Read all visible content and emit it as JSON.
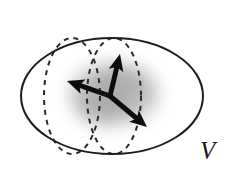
{
  "figure": {
    "background_color": "#ffffff",
    "width": 231,
    "height": 173
  },
  "labels": {
    "region": {
      "text": "V",
      "name": "volume-label-V",
      "x": 200,
      "y": 138,
      "font_size": 25,
      "color": "#1a1a1a",
      "style": "italic-serif"
    }
  },
  "shapes": {
    "outer_ellipse": {
      "name": "outer-ellipse",
      "cx": 112,
      "cy": 96,
      "rx": 91,
      "ry": 58,
      "stroke": "#1f1f1f",
      "stroke_width": 2.0,
      "fill": "none",
      "dashed": false
    },
    "dashed_ellipse_left": {
      "name": "dashed-ellipse-left",
      "cx": 72,
      "cy": 96,
      "rx": 28,
      "ry": 58,
      "stroke": "#2a2a2a",
      "stroke_width": 2.0,
      "dash_pattern": "5 5",
      "fill": "none"
    },
    "dashed_ellipse_right": {
      "name": "dashed-ellipse-right",
      "cx": 114,
      "cy": 96,
      "rx": 27,
      "ry": 58,
      "stroke": "#2a2a2a",
      "stroke_width": 2.0,
      "dash_pattern": "5 5",
      "fill": "none"
    },
    "blur_cloud": {
      "name": "gray-blur-cloud",
      "cx": 114,
      "cy": 94,
      "rx": 44,
      "ry": 30,
      "color": "#9a9a9a",
      "opacity": 0.62,
      "blur": 9
    }
  },
  "vectors": {
    "origin": {
      "x": 110,
      "y": 96
    },
    "stroke": "#0d0d0d",
    "stroke_width": 5.0,
    "head_length": 17,
    "head_width": 15,
    "items": [
      {
        "name": "vector-up",
        "label": "up",
        "from_x": 110,
        "from_y": 96,
        "to_x": 120,
        "to_y": 54,
        "angle_deg": 283,
        "length": 43
      },
      {
        "name": "vector-left",
        "label": "left",
        "from_x": 110,
        "from_y": 96,
        "to_x": 67,
        "to_y": 81,
        "angle_deg": 161,
        "length": 46
      },
      {
        "name": "vector-down-right",
        "label": "down-right",
        "from_x": 110,
        "from_y": 96,
        "to_x": 147,
        "to_y": 127,
        "angle_deg": 40,
        "length": 48
      }
    ]
  }
}
